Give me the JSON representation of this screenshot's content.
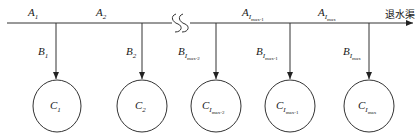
{
  "diagram": {
    "outlet_label": "退水渠",
    "break_symbol": "SS",
    "colors": {
      "line": "#333333",
      "text": "#1a1a1a",
      "background": "#ffffff"
    },
    "main_segments": [
      {
        "base": "A",
        "sub": "1",
        "subsub": ""
      },
      {
        "base": "A",
        "sub": "2",
        "subsub": ""
      },
      {
        "base": "A",
        "sub": "I",
        "subsub": "max-1"
      },
      {
        "base": "A",
        "sub": "I",
        "subsub": "max"
      }
    ],
    "branches": [
      {
        "base": "B",
        "sub": "1",
        "subsub": ""
      },
      {
        "base": "B",
        "sub": "2",
        "subsub": ""
      },
      {
        "base": "B",
        "sub": "I",
        "subsub": "max-2"
      },
      {
        "base": "B",
        "sub": "I",
        "subsub": "max-1"
      },
      {
        "base": "B",
        "sub": "I",
        "subsub": "max"
      }
    ],
    "nodes": [
      {
        "base": "C",
        "sub": "1",
        "subsub": ""
      },
      {
        "base": "C",
        "sub": "2",
        "subsub": ""
      },
      {
        "base": "C",
        "sub": "I",
        "subsub": "max-2"
      },
      {
        "base": "C",
        "sub": "I",
        "subsub": "max-1"
      },
      {
        "base": "C",
        "sub": "I",
        "subsub": "max"
      }
    ]
  }
}
